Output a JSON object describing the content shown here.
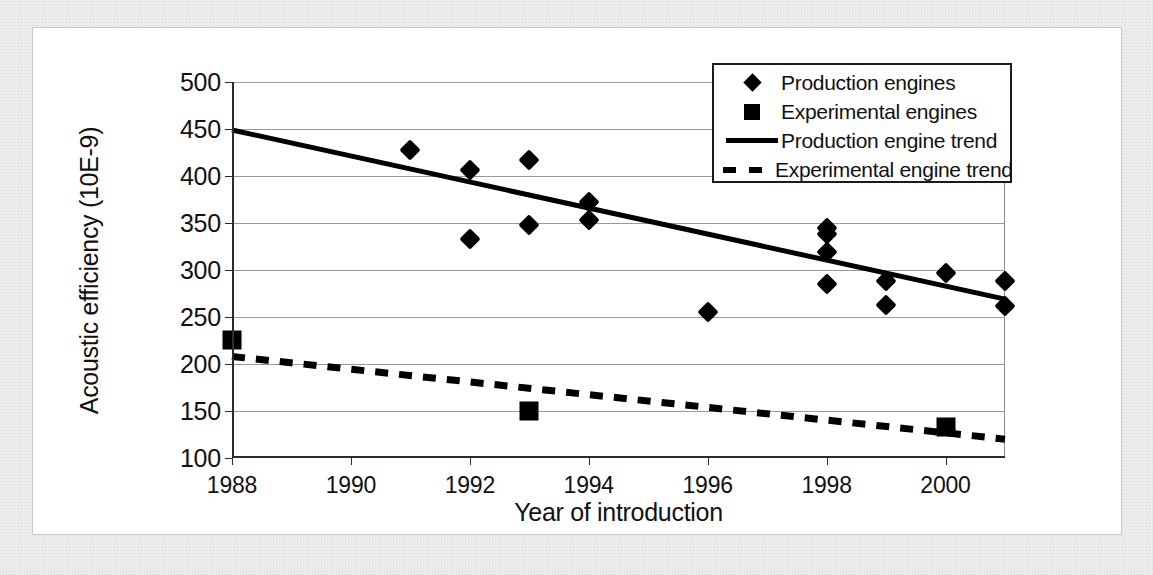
{
  "figure": {
    "background_color": "#ffffff",
    "page_color": "#eeeeee"
  },
  "axes": {
    "x_title": "Year of introduction",
    "y_title": "Acoustic efficiency (10E-9)",
    "x_ticks": [
      "1988",
      "1990",
      "1992",
      "1994",
      "1996",
      "1998",
      "2000"
    ],
    "y_ticks": [
      "500",
      "450",
      "400",
      "350",
      "300",
      "250",
      "200",
      "150",
      "100"
    ]
  },
  "legend": {
    "items": [
      {
        "key": "diamond-marker",
        "label": "Production engines"
      },
      {
        "key": "square-marker",
        "label": "Experimental engines"
      },
      {
        "key": "solid-line",
        "label": "Production engine trend"
      },
      {
        "key": "dashed-line",
        "label": "Experimental engine trend"
      }
    ]
  },
  "chart_data": {
    "type": "scatter",
    "title": "",
    "xlabel": "Year of introduction",
    "ylabel": "Acoustic efficiency (10E-9)",
    "xlim": [
      1988,
      2001
    ],
    "ylim": [
      100,
      500
    ],
    "x_tick_values": [
      1988,
      1990,
      1992,
      1994,
      1996,
      1998,
      2000
    ],
    "y_tick_values": [
      100,
      150,
      200,
      250,
      300,
      350,
      400,
      450,
      500
    ],
    "grid": "horizontal",
    "legend_position": "top-right",
    "series": [
      {
        "name": "Production engines",
        "type": "scatter",
        "marker": "diamond",
        "color": "#000000",
        "points": [
          {
            "x": 1991,
            "y": 428
          },
          {
            "x": 1992,
            "y": 406
          },
          {
            "x": 1992,
            "y": 333
          },
          {
            "x": 1993,
            "y": 417
          },
          {
            "x": 1993,
            "y": 348
          },
          {
            "x": 1994,
            "y": 372
          },
          {
            "x": 1994,
            "y": 353
          },
          {
            "x": 1996,
            "y": 255
          },
          {
            "x": 1998,
            "y": 345
          },
          {
            "x": 1998,
            "y": 338
          },
          {
            "x": 1998,
            "y": 319
          },
          {
            "x": 1998,
            "y": 285
          },
          {
            "x": 1999,
            "y": 288
          },
          {
            "x": 1999,
            "y": 263
          },
          {
            "x": 2000,
            "y": 297
          },
          {
            "x": 2001,
            "y": 288
          },
          {
            "x": 2001,
            "y": 262
          }
        ]
      },
      {
        "name": "Experimental engines",
        "type": "scatter",
        "marker": "square",
        "color": "#000000",
        "points": [
          {
            "x": 1988,
            "y": 226
          },
          {
            "x": 1993,
            "y": 150
          },
          {
            "x": 2000,
            "y": 133
          }
        ]
      },
      {
        "name": "Production engine trend",
        "type": "line",
        "style": "solid",
        "color": "#000000",
        "points": [
          {
            "x": 1988,
            "y": 449
          },
          {
            "x": 2001,
            "y": 269
          }
        ]
      },
      {
        "name": "Experimental engine trend",
        "type": "line",
        "style": "dashed",
        "color": "#000000",
        "points": [
          {
            "x": 1988,
            "y": 208
          },
          {
            "x": 2001,
            "y": 120
          }
        ]
      }
    ]
  }
}
